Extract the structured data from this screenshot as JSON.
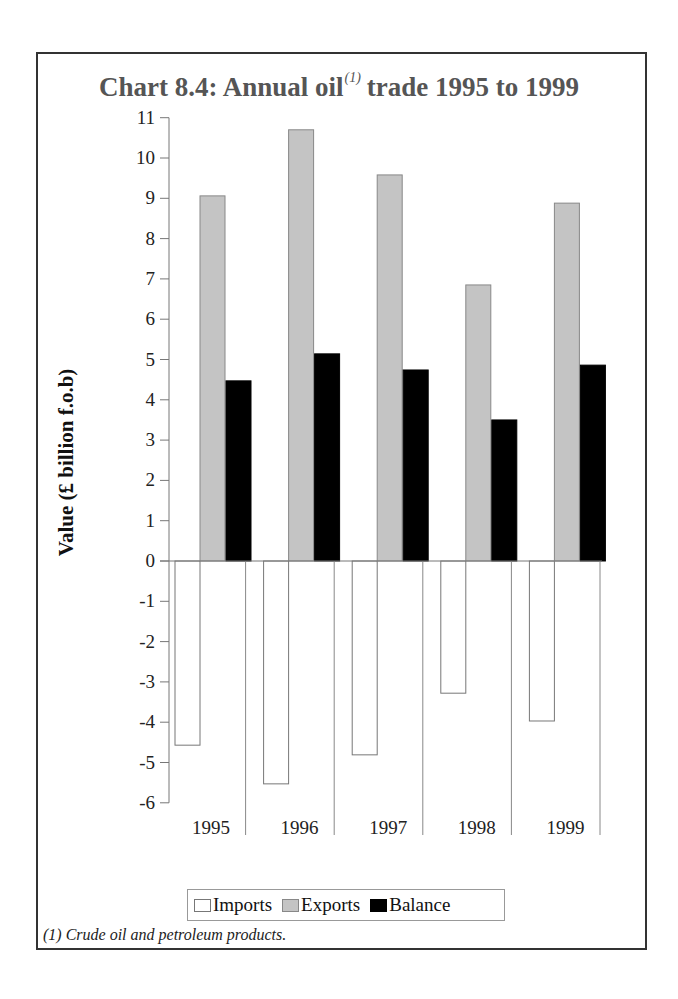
{
  "title": {
    "main": "Chart 8.4: Annual oil",
    "superscript": "(1)",
    "rest": "trade 1995 to 1999"
  },
  "footnote": "(1) Crude oil and petroleum products.",
  "legend": [
    {
      "label": "Imports",
      "color": "#ffffff",
      "border": "#777777"
    },
    {
      "label": "Exports",
      "color": "#c4c4c4",
      "border": "#888888"
    },
    {
      "label": "Balance",
      "color": "#000000",
      "border": "#000000"
    }
  ],
  "chart_data": {
    "type": "bar",
    "xlabel": "",
    "ylabel": "Value (£ billion f.o.b)",
    "categories": [
      "1995",
      "1996",
      "1997",
      "1998",
      "1999"
    ],
    "series": [
      {
        "name": "Imports",
        "values": [
          -4.57,
          -5.53,
          -4.81,
          -3.28,
          -3.97
        ]
      },
      {
        "name": "Exports",
        "values": [
          9.06,
          10.7,
          9.58,
          6.85,
          8.88
        ]
      },
      {
        "name": "Balance",
        "values": [
          4.47,
          5.14,
          4.74,
          3.5,
          4.86
        ]
      }
    ],
    "ylim": [
      -6,
      11
    ],
    "yticks": [
      11,
      10,
      9,
      8,
      7,
      6,
      5,
      4,
      3,
      2,
      1,
      0,
      -1,
      -2,
      -3,
      -4,
      -5,
      -6
    ],
    "grid": false,
    "legend_position": "bottom",
    "footnote": "(1) Crude oil and petroleum products."
  }
}
